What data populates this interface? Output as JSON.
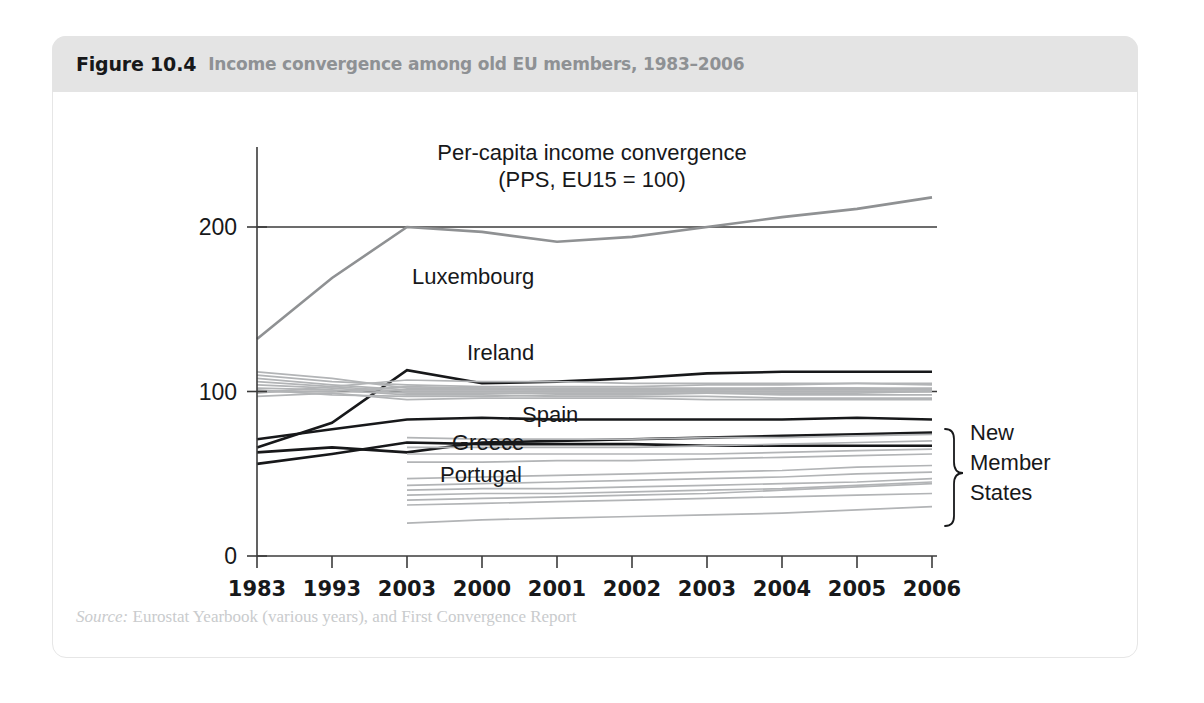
{
  "figure": {
    "number": "Figure 10.4",
    "caption": "Income convergence among old EU members, 1983–2006",
    "source_label": "Source:",
    "source_text": " Eurostat Yearbook (various years), and First Convergence Report"
  },
  "chart_data": {
    "type": "line",
    "title": "Per-capita income convergence",
    "subtitle": "(PPS, EU15 = 100)",
    "xlabel": "",
    "ylabel": "",
    "ylim": [
      0,
      240
    ],
    "yticks": [
      0,
      100,
      200
    ],
    "ytick_labels": [
      "0",
      "100",
      "200"
    ],
    "grid": false,
    "reference_lines": [
      100,
      200
    ],
    "legend_position": "inline-annotations",
    "categories": [
      "1983",
      "1993",
      "2003",
      "2000",
      "2001",
      "2002",
      "2003",
      "2004",
      "2005",
      "2006"
    ],
    "x": [
      0,
      1,
      2,
      3,
      4,
      5,
      6,
      7,
      8,
      9
    ],
    "annotations": [
      {
        "text": "Luxembourg",
        "x": 1.35,
        "y": 170
      },
      {
        "text": "Ireland",
        "x": 1.75,
        "y": 128
      },
      {
        "text": "Spain",
        "x": 3.6,
        "y": 86
      },
      {
        "text": "Greece",
        "x": 2.6,
        "y": 72
      },
      {
        "text": "Portugal",
        "x": 2.6,
        "y": 60
      },
      {
        "text": "New Member States",
        "x": 9.5,
        "y": 50
      }
    ],
    "group_label_lines": [
      "New",
      "Member",
      "States"
    ],
    "series": [
      {
        "name": "Luxembourg",
        "style": "light-grey-thick",
        "values": [
          132,
          169,
          200,
          197,
          191,
          194,
          200,
          206,
          211,
          218
        ]
      },
      {
        "name": "Ireland",
        "style": "black",
        "values": [
          66,
          81,
          113,
          105,
          106,
          108,
          111,
          112,
          112,
          112
        ]
      },
      {
        "name": "Spain",
        "style": "black",
        "values": [
          71,
          77,
          83,
          84,
          83,
          83,
          83,
          83,
          84,
          83
        ]
      },
      {
        "name": "Greece",
        "style": "black",
        "values": [
          63,
          66,
          63,
          69,
          70,
          71,
          72,
          73,
          74,
          75
        ]
      },
      {
        "name": "Portugal",
        "style": "black",
        "values": [
          56,
          62,
          69,
          68,
          68,
          68,
          67,
          67,
          67,
          67
        ]
      },
      {
        "name": "EU15 old member",
        "style": "grey",
        "values": [
          110,
          106,
          104,
          103,
          103,
          103,
          104,
          104,
          105,
          105
        ]
      },
      {
        "name": "EU15 old member",
        "style": "grey",
        "values": [
          108,
          104,
          101,
          101,
          101,
          101,
          101,
          102,
          102,
          102
        ]
      },
      {
        "name": "EU15 old member",
        "style": "grey",
        "values": [
          106,
          103,
          100,
          100,
          100,
          100,
          100,
          100,
          100,
          100
        ]
      },
      {
        "name": "EU15 old member",
        "style": "grey",
        "values": [
          104,
          102,
          99,
          99,
          99,
          99,
          99,
          98,
          98,
          98
        ]
      },
      {
        "name": "EU15 old member",
        "style": "grey",
        "values": [
          102,
          101,
          98,
          98,
          97,
          97,
          97,
          96,
          96,
          96
        ]
      },
      {
        "name": "EU15 old member",
        "style": "grey",
        "values": [
          100,
          100,
          103,
          102,
          102,
          102,
          102,
          102,
          102,
          101
        ]
      },
      {
        "name": "EU15 old member",
        "style": "grey",
        "values": [
          99,
          103,
          107,
          106,
          106,
          105,
          105,
          105,
          105,
          104
        ]
      },
      {
        "name": "EU15 old member",
        "style": "grey",
        "values": [
          97,
          99,
          95,
          96,
          96,
          96,
          95,
          95,
          95,
          95
        ]
      },
      {
        "name": "EU15 old member",
        "style": "grey",
        "values": [
          112,
          108,
          102,
          102,
          101,
          101,
          101,
          101,
          101,
          101
        ]
      },
      {
        "name": "EU15 old member",
        "style": "grey",
        "values": [
          101,
          98,
          97,
          97,
          98,
          98,
          99,
          99,
          99,
          100
        ]
      },
      {
        "name": "New Member State",
        "style": "grey",
        "values": [
          null,
          null,
          72,
          71,
          71,
          71,
          72,
          72,
          73,
          74
        ]
      },
      {
        "name": "New Member State",
        "style": "grey",
        "values": [
          null,
          null,
          66,
          66,
          66,
          66,
          67,
          68,
          69,
          70
        ]
      },
      {
        "name": "New Member State",
        "style": "grey",
        "values": [
          null,
          null,
          62,
          62,
          62,
          62,
          62,
          63,
          64,
          65
        ]
      },
      {
        "name": "New Member State",
        "style": "grey",
        "values": [
          null,
          null,
          57,
          57,
          58,
          58,
          59,
          60,
          61,
          62
        ]
      },
      {
        "name": "New Member State",
        "style": "grey",
        "values": [
          null,
          null,
          47,
          48,
          49,
          50,
          51,
          52,
          54,
          55
        ]
      },
      {
        "name": "New Member State",
        "style": "grey",
        "values": [
          null,
          null,
          43,
          44,
          45,
          46,
          47,
          48,
          50,
          51
        ]
      },
      {
        "name": "New Member State",
        "style": "grey",
        "values": [
          null,
          null,
          40,
          41,
          41,
          42,
          43,
          44,
          45,
          47
        ]
      },
      {
        "name": "New Member State",
        "style": "grey",
        "values": [
          null,
          null,
          37,
          38,
          38,
          39,
          40,
          41,
          43,
          45
        ]
      },
      {
        "name": "New Member State",
        "style": "grey",
        "values": [
          null,
          null,
          34,
          35,
          36,
          37,
          38,
          40,
          42,
          44
        ]
      },
      {
        "name": "New Member State",
        "style": "grey",
        "values": [
          null,
          null,
          31,
          32,
          33,
          34,
          35,
          36,
          37,
          38
        ]
      },
      {
        "name": "New Member State",
        "style": "grey",
        "values": [
          null,
          null,
          20,
          22,
          23,
          24,
          25,
          26,
          28,
          30
        ]
      }
    ]
  }
}
